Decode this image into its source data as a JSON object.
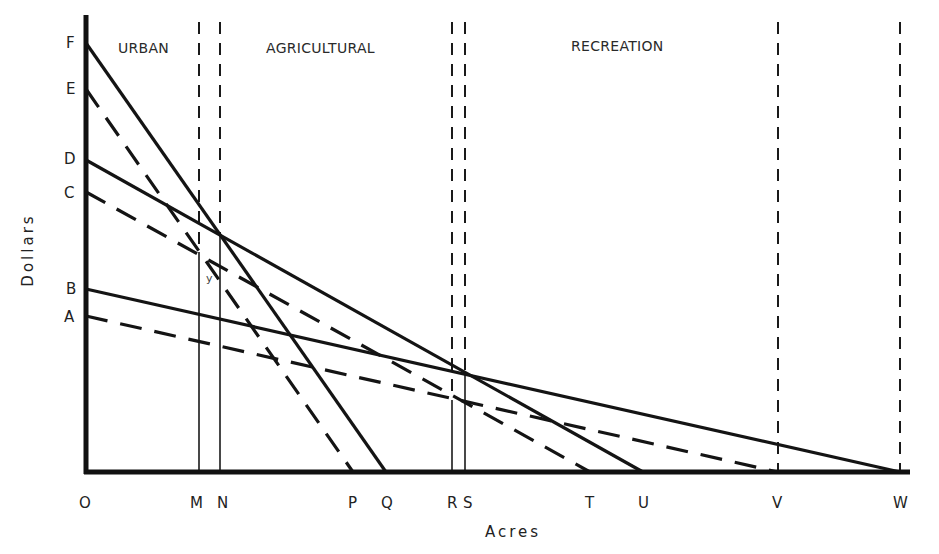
{
  "chart_data": {
    "type": "line",
    "title": "",
    "xlabel": "Acres",
    "ylabel": "Dollars",
    "grid": false,
    "legend": null,
    "regions": [
      "URBAN",
      "AGRICULTURAL",
      "RECREATION"
    ],
    "y_ticks": [
      "A",
      "B",
      "C",
      "D",
      "E",
      "F"
    ],
    "x_ticks": [
      "O",
      "M",
      "N",
      "P",
      "Q",
      "R",
      "S",
      "T",
      "U",
      "V",
      "W"
    ],
    "axis_pixels": {
      "origin": [
        86,
        472
      ],
      "y_top": 15,
      "x_right": 910,
      "y": {
        "F": 43,
        "E": 89,
        "D": 160,
        "C": 192,
        "B": 289,
        "A": 316
      },
      "x": {
        "O": 86,
        "M": 199,
        "N": 220,
        "P": 353,
        "Q": 386,
        "R": 452,
        "S": 465,
        "T": 590,
        "U": 643,
        "V": 778,
        "W": 900
      }
    },
    "series": [
      {
        "name": "F-Q",
        "from": "F",
        "to": "Q",
        "style": "solid"
      },
      {
        "name": "E-P",
        "from": "E",
        "to": "P",
        "style": "dashed"
      },
      {
        "name": "D-U",
        "from": "D",
        "to": "U",
        "style": "solid"
      },
      {
        "name": "C-T",
        "from": "C",
        "to": "T",
        "style": "dashed"
      },
      {
        "name": "B-W",
        "from": "B",
        "to": "W",
        "style": "solid"
      },
      {
        "name": "A-V",
        "from": "A",
        "to": "V",
        "style": "dashed"
      }
    ],
    "verticals": [
      {
        "at": "M",
        "dashed_to_y": 252
      },
      {
        "at": "N",
        "dashed_to_y": 235
      },
      {
        "at": "R",
        "dashed_to_y": 400
      },
      {
        "at": "S",
        "dashed_to_y": 372
      },
      {
        "at": "V",
        "dashed_to_y": 472
      },
      {
        "at": "W",
        "dashed_to_y": 472
      }
    ],
    "annotations": [
      {
        "text": "y",
        "x": 206,
        "y": 282
      }
    ]
  },
  "labels": {
    "regions": [
      {
        "text": "URBAN",
        "x": 118,
        "y": 40
      },
      {
        "text": "AGRICULTURAL",
        "x": 266,
        "y": 40
      },
      {
        "text": "RECREATION",
        "x": 571,
        "y": 38
      }
    ],
    "y_ticks": [
      {
        "text": "F",
        "x": 66,
        "y": 36
      },
      {
        "text": "E",
        "x": 66,
        "y": 82
      },
      {
        "text": "D",
        "x": 64,
        "y": 152
      },
      {
        "text": "C",
        "x": 64,
        "y": 186
      },
      {
        "text": "B",
        "x": 66,
        "y": 282
      },
      {
        "text": "A",
        "x": 64,
        "y": 310
      }
    ],
    "x_ticks": [
      {
        "text": "O",
        "x": 79,
        "y": 496
      },
      {
        "text": "M",
        "x": 190,
        "y": 496
      },
      {
        "text": "N",
        "x": 217,
        "y": 496
      },
      {
        "text": "P",
        "x": 348,
        "y": 496
      },
      {
        "text": "Q",
        "x": 381,
        "y": 496
      },
      {
        "text": "R",
        "x": 447,
        "y": 496
      },
      {
        "text": "S",
        "x": 463,
        "y": 496
      },
      {
        "text": "T",
        "x": 585,
        "y": 496
      },
      {
        "text": "U",
        "x": 638,
        "y": 496
      },
      {
        "text": "V",
        "x": 772,
        "y": 496
      },
      {
        "text": "W",
        "x": 893,
        "y": 496
      }
    ],
    "xlabel": {
      "text": "Acres",
      "x": 485,
      "y": 523
    },
    "ylabel": {
      "text": "Dollars",
      "cx": 28,
      "cy": 250
    }
  }
}
